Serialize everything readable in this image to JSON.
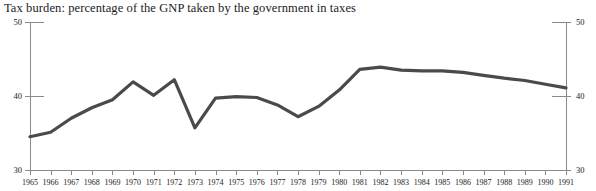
{
  "chart_data": {
    "type": "line",
    "title": "Tax burden: percentage of the GNP taken by the government in taxes",
    "xlabel": "",
    "ylabel": "",
    "ylim": [
      30,
      50
    ],
    "yticks": [
      30,
      40,
      50
    ],
    "yticks_right": [
      30,
      40,
      50
    ],
    "grid": false,
    "legend": "none",
    "axes": {
      "left_axis_labels": [
        "50",
        "40",
        "30"
      ],
      "right_axis_labels": [
        "50",
        "40",
        "30"
      ]
    },
    "line_color": "#4a4a4a",
    "categories": [
      "1965",
      "1966",
      "1967",
      "1968",
      "1969",
      "1970",
      "1971",
      "1972",
      "1973",
      "1974",
      "1975",
      "1976",
      "1977",
      "1978",
      "1979",
      "1980",
      "1981",
      "1982",
      "1983",
      "1984",
      "1985",
      "1986",
      "1987",
      "1988",
      "1989",
      "1990",
      "1991"
    ],
    "series": [
      {
        "name": "Tax burden (% of GNP)",
        "values": [
          34.5,
          35.1,
          37.0,
          38.4,
          39.5,
          41.9,
          40.1,
          42.2,
          35.7,
          39.7,
          39.9,
          39.8,
          38.8,
          37.2,
          38.6,
          40.8,
          43.6,
          43.9,
          43.5,
          43.4,
          43.4,
          43.2,
          42.8,
          42.4,
          42.1,
          41.6,
          41.1
        ]
      }
    ]
  }
}
